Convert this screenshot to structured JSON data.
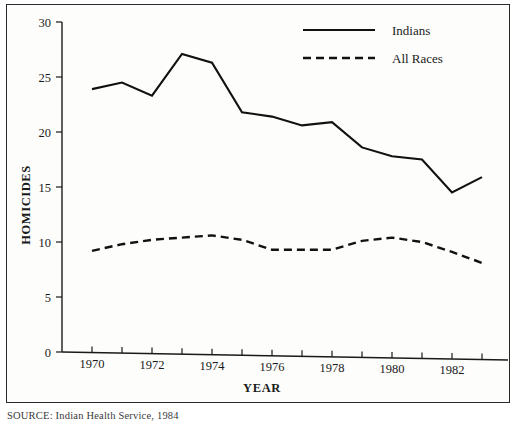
{
  "figure": {
    "source_note": "SOURCE: Indian Health Service, 1984"
  },
  "chart_data": {
    "type": "line",
    "title": "",
    "xlabel": "YEAR",
    "ylabel": "HOMICIDES",
    "xlim": [
      1969,
      1983.6
    ],
    "ylim": [
      0,
      30
    ],
    "grid": false,
    "legend_position": "top-right",
    "x": [
      1970,
      1971,
      1972,
      1973,
      1974,
      1975,
      1976,
      1977,
      1978,
      1979,
      1980,
      1981,
      1982,
      1983
    ],
    "x_tick_labels": [
      "1970",
      "1972",
      "1974",
      "1976",
      "1978",
      "1980",
      "1982"
    ],
    "x_tick_values": [
      1970,
      1972,
      1974,
      1976,
      1978,
      1980,
      1982
    ],
    "x_minor_tick_values": [
      1971,
      1973,
      1975,
      1977,
      1979,
      1981,
      1983
    ],
    "y_tick_labels": [
      "0",
      "5",
      "10",
      "15",
      "20",
      "25",
      "30"
    ],
    "y_tick_values": [
      0,
      5,
      10,
      15,
      20,
      25,
      30
    ],
    "series": [
      {
        "name": "Indians",
        "style": "solid",
        "color": "#111111",
        "values": [
          23.9,
          24.5,
          23.3,
          27.1,
          26.3,
          21.8,
          21.4,
          20.6,
          20.9,
          18.6,
          17.8,
          17.5,
          14.5,
          15.9
        ]
      },
      {
        "name": "All Races",
        "style": "dashed",
        "color": "#111111",
        "values": [
          9.2,
          9.8,
          10.2,
          10.4,
          10.6,
          10.2,
          9.3,
          9.3,
          9.3,
          10.1,
          10.4,
          10.0,
          9.1,
          8.1
        ]
      }
    ]
  }
}
